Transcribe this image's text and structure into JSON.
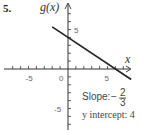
{
  "problem_number": "5.",
  "chart_data": {
    "type": "line",
    "title": "",
    "ylabel": "g(x)",
    "xlabel": "x",
    "xlim": [
      -8,
      8
    ],
    "ylim": [
      -8,
      8
    ],
    "xticks": [
      -5,
      0,
      5
    ],
    "yticks": [
      5,
      -5
    ],
    "xtick_labels": [
      "-5",
      "0",
      "5"
    ],
    "ytick_labels": [
      "5",
      "-5"
    ],
    "series": [
      {
        "name": "g(x)",
        "x": [
          -2,
          8
        ],
        "y": [
          5.333,
          -1.333
        ],
        "color": "#222222"
      }
    ],
    "slope": {
      "label": "Slope:",
      "numerator": "2",
      "denominator": "3",
      "sign": "−"
    },
    "intercept": {
      "label": "y intercept: 4"
    },
    "grid": false
  }
}
